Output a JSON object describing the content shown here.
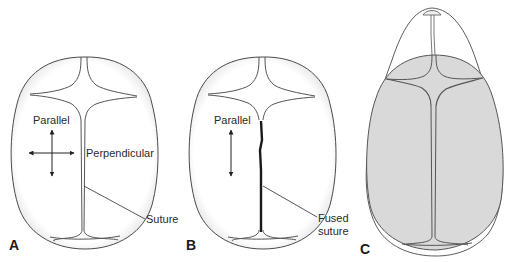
{
  "panels": [
    {
      "id": "A",
      "letter": "A",
      "labels": {
        "parallel": "Parallel",
        "perpendicular": "Perpendicular",
        "suture": "Suture"
      },
      "arrows": [
        "vertical",
        "horizontal"
      ]
    },
    {
      "id": "B",
      "letter": "B",
      "labels": {
        "parallel": "Parallel",
        "fused_line1": "Fused",
        "fused_line2": "suture"
      },
      "arrows": [
        "vertical"
      ]
    },
    {
      "id": "C",
      "letter": "C",
      "labels": {}
    }
  ],
  "colors": {
    "outline": "#4a4a4a",
    "fused_suture": "#1a1a1a",
    "skull_fill_C": "#d9d9d9",
    "background": "#ffffff"
  }
}
